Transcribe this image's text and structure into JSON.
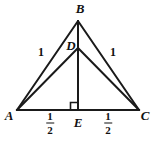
{
  "figure": {
    "type": "geometry-diagram",
    "width": 152,
    "height": 141,
    "background_color": "#ffffff",
    "stroke_color": "#1a1a1a"
  },
  "points": {
    "A": {
      "label": "A",
      "x": 17,
      "y": 110,
      "label_x": 9,
      "label_y": 115
    },
    "B": {
      "label": "B",
      "x": 78,
      "y": 21,
      "label_x": 80,
      "label_y": 8
    },
    "C": {
      "label": "C",
      "x": 139,
      "y": 110,
      "label_x": 145,
      "label_y": 115
    },
    "D": {
      "label": "D",
      "x": 78,
      "y": 48,
      "label_x": 71,
      "label_y": 45
    },
    "E": {
      "label": "E",
      "x": 78,
      "y": 110,
      "label_x": 78,
      "label_y": 122
    }
  },
  "segments": [
    {
      "name": "AB",
      "from": "A",
      "to": "B"
    },
    {
      "name": "BC",
      "from": "B",
      "to": "C"
    },
    {
      "name": "AD",
      "from": "A",
      "to": "D"
    },
    {
      "name": "DC",
      "from": "D",
      "to": "C"
    },
    {
      "name": "BE",
      "from": "B",
      "to": "E"
    },
    {
      "name": "AC",
      "from": "A",
      "to": "C"
    }
  ],
  "measure_labels": {
    "ab_length": {
      "text": "1",
      "x": 41,
      "y": 52
    },
    "bc_length": {
      "text": "1",
      "x": 113,
      "y": 52
    },
    "ae_length": {
      "numerator": "1",
      "denominator": "2",
      "x": 50,
      "y": 123
    },
    "ec_length": {
      "numerator": "1",
      "denominator": "2",
      "x": 108,
      "y": 123
    }
  },
  "markers": {
    "right_angle_at_E": {
      "name": "right-angle-marker",
      "x": 71,
      "y": 103,
      "size": 7
    }
  }
}
